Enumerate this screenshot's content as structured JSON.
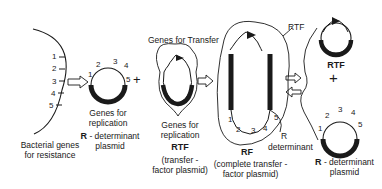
{
  "diagram": {
    "bacterial_genes": {
      "label_line1": "Bacterial genes",
      "label_line2": "for resistance",
      "gene_numbers": [
        "1",
        "2",
        "3",
        "4",
        "5"
      ]
    },
    "r_determinant_left": {
      "gene_numbers": [
        "1",
        "2",
        "3",
        "4",
        "5"
      ],
      "replication_line1": "Genes for",
      "replication_line2": "replication",
      "name_bold": "R",
      "name_rest": " - determinant",
      "name_line2": "plasmid"
    },
    "plus_signs": [
      "+",
      "+"
    ],
    "rtf_middle": {
      "transfer_label": "Genes for Transfer",
      "replication_line1": "Genes for",
      "replication_line2": "replication",
      "name": "RTF",
      "desc_line1": "(transfer -",
      "desc_line2": "factor plasmid)"
    },
    "rf_complete": {
      "rtf_label": "RTF",
      "gene_numbers": [
        "1",
        "2",
        "3",
        "4",
        "5"
      ],
      "r_label": "R",
      "determinant_label": "determinant",
      "name": "RF",
      "desc_line1": "(complete transfer -",
      "desc_line2": "factor plasmid)"
    },
    "rtf_right": {
      "name": "RTF"
    },
    "r_determinant_right": {
      "gene_numbers": [
        "1",
        "2",
        "3",
        "4",
        "5"
      ],
      "name_bold": "R",
      "name_rest": " - determinant",
      "name_line2": "plasmid"
    },
    "colors": {
      "ink": "#1a1a1a",
      "background": "#ffffff"
    }
  }
}
